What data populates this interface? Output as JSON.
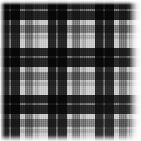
{
  "image": {
    "kind": "textile-swatch",
    "subject": "plaid",
    "alt_text": "Grayscale plaid tartan fabric swatch",
    "width_px": 141,
    "height_px": 141,
    "orientation": "square"
  },
  "pattern": {
    "name": "Black and white plaid",
    "weave": "tartan check",
    "repeat_px": 47,
    "tiles_across": 3,
    "tiles_down": 3,
    "symmetry": "same sett in warp and weft"
  },
  "palette": {
    "darkest": "#2b2b2b",
    "mid_dark": "#575757",
    "mid": "#8e8e8e",
    "light_gray": "#c9c9c9",
    "lightest": "#f2f2f2",
    "ground": "#e4e4e4",
    "pin_stripe": "#ffffff"
  },
  "sett": {
    "description": "One repeat, measured in pixels from the tile origin",
    "bands": [
      {
        "label": "pin line",
        "start": 0,
        "width": 1,
        "color": "#f2f2f2",
        "weight": "hairline"
      },
      {
        "label": "heavy block",
        "start": 1,
        "width": 19,
        "color": "#2b2b2b",
        "weight": "wide"
      },
      {
        "label": "light gap",
        "start": 20,
        "width": 5,
        "color": "#ededed",
        "weight": "narrow"
      },
      {
        "label": "mid band",
        "start": 25,
        "width": 8,
        "color": "#8e8e8e",
        "weight": "medium"
      },
      {
        "label": "pale line",
        "start": 33,
        "width": 2,
        "color": "#e8e8e8",
        "weight": "hairline"
      },
      {
        "label": "gray line",
        "start": 35,
        "width": 4,
        "color": "#c9c9c9",
        "weight": "narrow"
      },
      {
        "label": "ground",
        "start": 39,
        "width": 8,
        "color": "#efefef",
        "weight": "wide"
      }
    ],
    "inner_pin_stripe": {
      "start": 9,
      "width": 2,
      "color": "#ffffff",
      "opacity": 0.42
    }
  },
  "edges": {
    "top_highlight": true,
    "bottom_highlight": true,
    "left_highlight": true,
    "right_highlight": true,
    "note": "blown-out white margin around the photographed cloth"
  },
  "chart_data": null
}
